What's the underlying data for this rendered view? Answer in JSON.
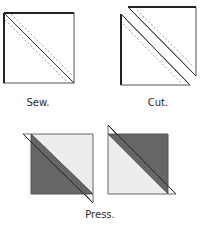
{
  "steps": [
    {
      "id": "sew",
      "label": "Sew."
    },
    {
      "id": "cut",
      "label": "Cut."
    },
    {
      "id": "press",
      "label": "Press."
    }
  ],
  "colors": {
    "outline": "#333333",
    "dashed": "#888888",
    "dark_fabric": "#666666",
    "light_fabric": "#ececec",
    "background": "#ffffff"
  }
}
